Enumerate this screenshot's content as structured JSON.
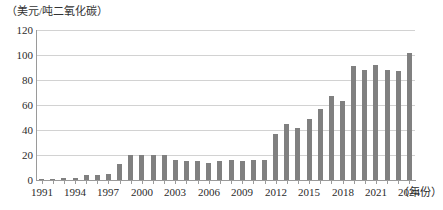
{
  "chart_data": {
    "type": "bar",
    "title": "",
    "subtitle": "",
    "ylabel": "（美元/吨二氧化碳）",
    "xlabel": "（年份）",
    "ylim": [
      0,
      120
    ],
    "ytick_step": 20,
    "ytick_labels": [
      "0",
      "20",
      "40",
      "60",
      "80",
      "100",
      "120"
    ],
    "grid": true,
    "legend": "none",
    "bar_color": "#808080",
    "gridline_color": "#d2d2d2",
    "axis_color": "#9a9a9a",
    "xtick_labels": [
      "1991",
      "1994",
      "1997",
      "2000",
      "2003",
      "2006",
      "2009",
      "2012",
      "2015",
      "2018",
      "2021",
      "2024"
    ],
    "categories": [
      "1991",
      "1992",
      "1993",
      "1994",
      "1995",
      "1996",
      "1997",
      "1998",
      "1999",
      "2000",
      "2001",
      "2002",
      "2003",
      "2004",
      "2005",
      "2006",
      "2007",
      "2008",
      "2009",
      "2010",
      "2011",
      "2012",
      "2013",
      "2014",
      "2015",
      "2016",
      "2017",
      "2018",
      "2019",
      "2020",
      "2021",
      "2022",
      "2023",
      "2024"
    ],
    "values": [
      1,
      1,
      2,
      2,
      4,
      4,
      5,
      13,
      20,
      20,
      20,
      20,
      16,
      15,
      15,
      14,
      15,
      16,
      15,
      16,
      16,
      37,
      45,
      42,
      49,
      57,
      67,
      63,
      91,
      88,
      92,
      88,
      87,
      102
    ]
  }
}
